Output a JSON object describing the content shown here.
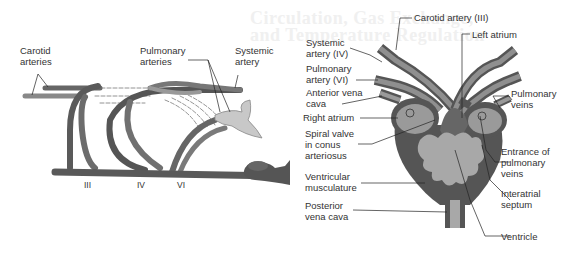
{
  "background_bleed_text": "Circulation, Gas Exchange,\nand Temperature Regulation",
  "left_diagram": {
    "title": "Aortic arches (lateral view)",
    "labels": {
      "carotid": "Carotid\narteries",
      "pulmonary": "Pulmonary\narteries",
      "systemic": "Systemic\nartery",
      "arch_iii": "III",
      "arch_iv": "IV",
      "arch_vi": "VI"
    }
  },
  "right_diagram": {
    "title": "Amphibian heart (ventral view)",
    "labels": {
      "carotid_artery": "Carotid artery (III)",
      "left_atrium": "Left atrium",
      "systemic_artery": "Systemic\nartery (IV)",
      "pulmonary_artery": "Pulmonary\nartery (VI)",
      "anterior_vena_cava": "Anterior vena\ncava",
      "pulmonary_veins": "Pulmonary\nveins",
      "right_atrium": "Right atrium",
      "spiral_valve": "Spiral valve\nin conus\narteriosus",
      "entrance_pulmonary_veins": "Entrance of\npulmonary\nveins",
      "ventricular_musculature": "Ventricular\nmusculature",
      "interatrial_septum": "Interatrial\nseptum",
      "posterior_vena_cava": "Posterior\nvena cava",
      "ventricle": "Ventricle"
    }
  },
  "colors": {
    "vessel_dark": "#5a5a5a",
    "vessel_mid": "#8a8a8a",
    "vessel_light": "#bdbdbd",
    "leader_line": "#222222"
  }
}
